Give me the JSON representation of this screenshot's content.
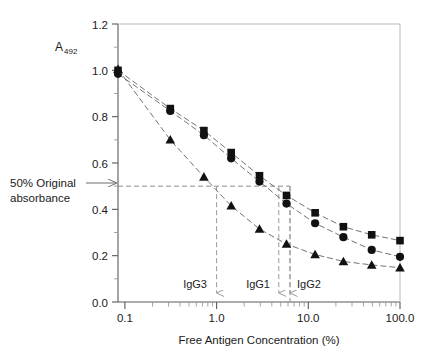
{
  "chart_data": {
    "type": "line",
    "title": "",
    "xlabel": "Free Antigen Concentration (%)",
    "ylabel": "A",
    "ylabel_sub": "492",
    "xscale": "log",
    "xlim": [
      0.1,
      100.0
    ],
    "ylim": [
      0.0,
      1.2
    ],
    "grid": false,
    "legend": "none",
    "xticks": [
      "0.1",
      "1.0",
      "10.0",
      "100.0"
    ],
    "xtick_values": [
      0.1,
      1.0,
      10.0,
      100.0
    ],
    "yticks": [
      "0.0",
      "0.2",
      "0.4",
      "0.6",
      "0.8",
      "1.0",
      "1.2"
    ],
    "ytick_values": [
      0.0,
      0.2,
      0.4,
      0.6,
      0.8,
      1.0,
      1.2
    ],
    "series": [
      {
        "name": "IgG2",
        "marker": "square",
        "color": "#111111",
        "x": [
          0.1,
          0.36,
          0.82,
          1.6,
          3.2,
          6.2,
          12.5,
          25.0,
          50.0,
          100.0
        ],
        "values": [
          1.0,
          0.835,
          0.74,
          0.645,
          0.545,
          0.46,
          0.385,
          0.325,
          0.29,
          0.265
        ]
      },
      {
        "name": "IgG1",
        "marker": "circle",
        "color": "#111111",
        "x": [
          0.1,
          0.36,
          0.82,
          1.6,
          3.2,
          6.2,
          12.5,
          25.0,
          50.0,
          100.0
        ],
        "values": [
          0.985,
          0.825,
          0.72,
          0.62,
          0.52,
          0.425,
          0.34,
          0.28,
          0.225,
          0.195
        ]
      },
      {
        "name": "IgG3",
        "marker": "triangle",
        "color": "#111111",
        "x": [
          0.1,
          0.36,
          0.82,
          1.6,
          3.2,
          6.2,
          12.5,
          25.0,
          50.0,
          100.0
        ],
        "values": [
          1.005,
          0.7,
          0.54,
          0.415,
          0.315,
          0.25,
          0.205,
          0.175,
          0.16,
          0.148
        ]
      }
    ],
    "reference_line": {
      "label_line1": "50% Original",
      "label_line2": "absorbance",
      "y_value": 0.5,
      "color": "#8c8c8c"
    },
    "drop_lines": [
      {
        "label": "IgG3",
        "x_value": 0.9
      },
      {
        "label": "IgG1",
        "x_value": 3.4
      },
      {
        "label": "IgG2",
        "x_value": 4.5
      }
    ]
  }
}
